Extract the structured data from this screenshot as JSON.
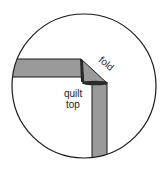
{
  "diagram": {
    "labels": {
      "fold": "fold",
      "quilt_line1": "quilt",
      "quilt_line2": "top"
    },
    "colors": {
      "background": "#ffffff",
      "outline": "#1a1a1a",
      "binding_fill": "#9a9a9a",
      "binding_dark": "#2a2a2a"
    }
  }
}
